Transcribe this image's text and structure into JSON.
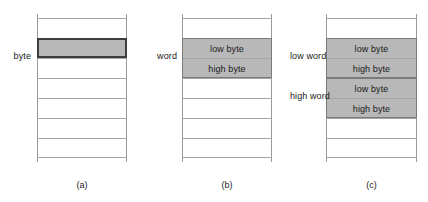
{
  "figure": {
    "colors": {
      "shaded_cell": "#b8b8b8",
      "cell_rule": "#a5a5a5",
      "rail": "#9a9a9a",
      "outline_strong": "#3d3d3d",
      "group_outline": "#7a7a7a",
      "background": "#ffffff",
      "text": "#1a1a1a"
    },
    "panels": [
      {
        "id": "panel-a",
        "caption": "(a)",
        "side_labels": [
          {
            "text": "byte",
            "row_index": 1
          }
        ],
        "cells": [
          {
            "text": "",
            "shaded": false
          },
          {
            "text": "",
            "shaded": true
          },
          {
            "text": "",
            "shaded": false
          },
          {
            "text": "",
            "shaded": false
          },
          {
            "text": "",
            "shaded": false
          },
          {
            "text": "",
            "shaded": false
          },
          {
            "text": "",
            "shaded": false
          }
        ]
      },
      {
        "id": "panel-b",
        "caption": "(b)",
        "side_labels": [
          {
            "text": "word",
            "row_index": 1
          }
        ],
        "cells": [
          {
            "text": "",
            "shaded": false
          },
          {
            "text": "low byte",
            "shaded": true
          },
          {
            "text": "high byte",
            "shaded": true
          },
          {
            "text": "",
            "shaded": false
          },
          {
            "text": "",
            "shaded": false
          },
          {
            "text": "",
            "shaded": false
          },
          {
            "text": "",
            "shaded": false
          }
        ]
      },
      {
        "id": "panel-c",
        "caption": "(c)",
        "side_labels": [
          {
            "text": "low word",
            "row_index": 1
          },
          {
            "text": "high word",
            "row_index": 3
          }
        ],
        "cells": [
          {
            "text": "",
            "shaded": false
          },
          {
            "text": "low byte",
            "shaded": true
          },
          {
            "text": "high byte",
            "shaded": true
          },
          {
            "text": "low byte",
            "shaded": true
          },
          {
            "text": "high byte",
            "shaded": true
          },
          {
            "text": "",
            "shaded": false
          },
          {
            "text": "",
            "shaded": false
          }
        ]
      }
    ]
  }
}
